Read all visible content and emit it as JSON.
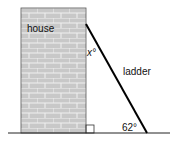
{
  "diagram": {
    "labels": {
      "house": "house",
      "ladder": "ladder",
      "top_angle": "x°",
      "bottom_angle": "62°"
    },
    "colors": {
      "brick_fill": "#c8c8c8",
      "mortar": "#f0f0f0",
      "outline": "#333333",
      "ladder": "#000000",
      "ground": "#222222"
    }
  }
}
